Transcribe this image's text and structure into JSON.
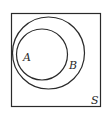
{
  "diagram": {
    "type": "venn",
    "universe": {
      "label": "S"
    },
    "sets": [
      {
        "label": "B",
        "contains": [
          "A"
        ]
      },
      {
        "label": "A",
        "subset_of": "B"
      }
    ],
    "colors": {
      "stroke": "#2a2a2a",
      "background": "#ffffff"
    }
  }
}
